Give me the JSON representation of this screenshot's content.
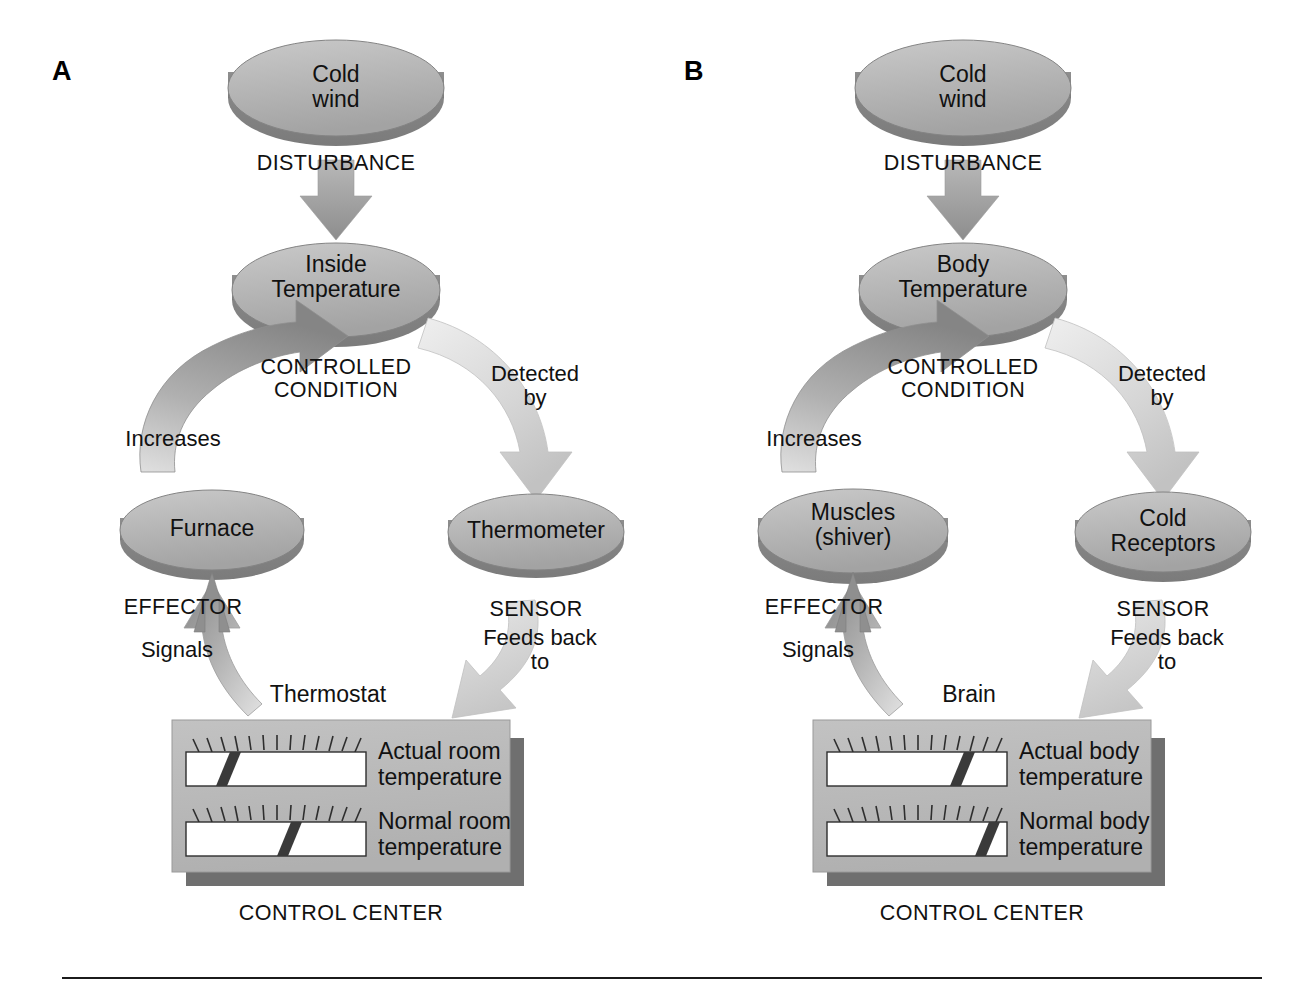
{
  "figure": {
    "type": "process-diagram",
    "divider": true
  },
  "panels": [
    {
      "letter": "A",
      "stimulus": {
        "label": "Cold\nwind",
        "name": "cold-wind"
      },
      "disturbance_label": "DISTURBANCE",
      "controlled": {
        "label": "Inside\nTemperature",
        "name": "inside-temperature"
      },
      "controlled_caption": "CONTROLLED\nCONDITION",
      "detected_label": "Detected\nby",
      "sensor": {
        "label": "Thermometer",
        "name": "thermometer"
      },
      "sensor_caption": "SENSOR",
      "feedback_label": "Feeds back\nto",
      "control_center_title": "Thermostat",
      "gauges": [
        {
          "label": "Actual room\ntemperature",
          "marker_pct": 29
        },
        {
          "label": "Normal room\ntemperature",
          "marker_pct": 58
        }
      ],
      "control_center_caption": "CONTROL CENTER",
      "signals_label": "Signals",
      "effector_caption": "EFFECTOR",
      "effector": {
        "label": "Furnace",
        "name": "furnace"
      },
      "increases_label": "Increases"
    },
    {
      "letter": "B",
      "stimulus": {
        "label": "Cold\nwind",
        "name": "cold-wind"
      },
      "disturbance_label": "DISTURBANCE",
      "controlled": {
        "label": "Body\nTemperature",
        "name": "body-temperature"
      },
      "controlled_caption": "CONTROLLED\nCONDITION",
      "detected_label": "Detected\nby",
      "sensor": {
        "label": "Cold\nReceptors",
        "name": "cold-receptors"
      },
      "sensor_caption": "SENSOR",
      "feedback_label": "Feeds back\nto",
      "control_center_title": "Brain",
      "gauges": [
        {
          "label": "Actual body\ntemperature",
          "marker_pct": 74
        },
        {
          "label": "Normal body\ntemperature",
          "marker_pct": 88
        }
      ],
      "control_center_caption": "CONTROL CENTER",
      "signals_label": "Signals",
      "effector_caption": "EFFECTOR",
      "effector": {
        "label": "Muscles\n(shiver)",
        "name": "muscles-shiver"
      },
      "increases_label": "Increases"
    }
  ],
  "colors": {
    "ellipse_fill": "#b3b3b3",
    "ellipse_shadow": "#8a8a8a",
    "ellipse_stroke": "#6e6e6e",
    "arrow_dark": "#8d8d8d",
    "arrow_light": "#d2d2d2",
    "box_fill": "#b9b9b9",
    "box_shadow": "#7d7d7d",
    "gauge_fill": "#ffffff",
    "marker": "#3a3a3a",
    "text": "#111111",
    "rule": "#1b1b1b"
  }
}
